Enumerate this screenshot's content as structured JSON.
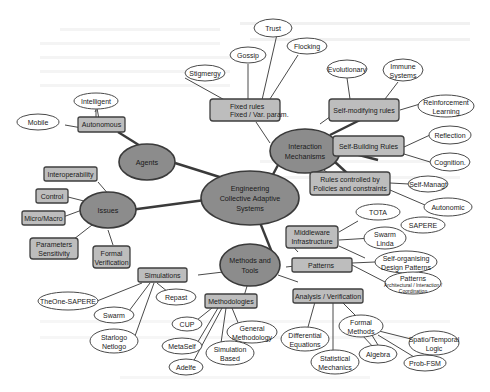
{
  "diagram": {
    "title": "Engineering Collective Adaptive Systems",
    "root": {
      "label_lines": [
        "Engineering",
        "Collective Adaptive",
        "Systems"
      ]
    },
    "hubs": {
      "agents": {
        "label": "Agents"
      },
      "interaction": {
        "label_lines": [
          "Interaction",
          "Mechanisms"
        ]
      },
      "issues": {
        "label": "Issues"
      },
      "methods": {
        "label_lines": [
          "Methods and",
          "Tools"
        ]
      }
    },
    "agents": {
      "autonomous": {
        "label": "Autonomous",
        "children": {
          "intelligent": "Intelligent",
          "mobile": "Mobile"
        }
      }
    },
    "interaction": {
      "fixed_rules": {
        "label_lines": [
          "Fixed rules",
          "Fixed / Var. param."
        ],
        "children": {
          "stigmergy": "Stigmergy",
          "gossip": "Gossip",
          "trust": "Trust",
          "flocking": "Flocking"
        }
      },
      "self_modifying": {
        "label": "Self-modifying rules",
        "children": {
          "evolutionary": "Evolutionary",
          "immune": [
            "Immune",
            "Systems"
          ],
          "reinforcement": [
            "Reinforcement",
            "Learning"
          ]
        }
      },
      "self_building": {
        "label": "Self-Building Rules",
        "children": {
          "reflection": "Reflection",
          "cognition": "Cognition."
        }
      },
      "policies": {
        "label_lines": [
          "Rules controlled by",
          "Policies and constraints"
        ],
        "children": {
          "self_managt": "Self-Managt",
          "autonomic": "Autonomic"
        }
      }
    },
    "issues": {
      "interoperability": {
        "label": "Interoperability"
      },
      "control": {
        "label": "Control"
      },
      "micro_macro": {
        "label": "Micro/Macro"
      },
      "parameters": {
        "label_lines": [
          "Parameters",
          "Sensitivity"
        ]
      },
      "formal_verification": {
        "label_lines": [
          "Formal",
          "Verification"
        ]
      }
    },
    "methods": {
      "middleware": {
        "label_lines": [
          "Middleware",
          "Infrastructure"
        ],
        "children": {
          "tota": "TOTA",
          "sapere": "SAPERE",
          "swarm_linda": [
            "Swarm",
            "Linda"
          ]
        }
      },
      "patterns": {
        "label": "Patterns",
        "children": {
          "self_org": [
            "Self-organising",
            "Design Patterns"
          ],
          "patterns_arch": [
            "Patterns",
            "Architectural / Interaction /",
            "Coordination"
          ]
        }
      },
      "analysis": {
        "label": "Analysis / Verification",
        "children": {
          "differential": [
            "Differential",
            "Equations"
          ],
          "statistical": [
            "Statistical",
            "Mechanics"
          ],
          "formal_methods": [
            "Formal",
            "Methods"
          ]
        }
      },
      "formal_methods_children": {
        "spatio": [
          "Spatio/Temporal",
          "Logic"
        ],
        "algebra": "Algebra",
        "prob_fsm": "Prob-FSM"
      },
      "simulations": {
        "label": "Simulations",
        "children": {
          "theone": "TheOne-SAPERE",
          "swarm": "Swarm",
          "starlogo": [
            "Starlogo",
            "Netlogo"
          ],
          "repast": "Repast"
        }
      },
      "methodologies": {
        "label": "Methodologies",
        "children": {
          "cup": "CUP",
          "metaself": "MetaSelf",
          "adelfe": "Adelfe",
          "simulation_based": [
            "Simulation",
            "Based"
          ],
          "general": [
            "General",
            "Methodology"
          ]
        }
      }
    }
  }
}
